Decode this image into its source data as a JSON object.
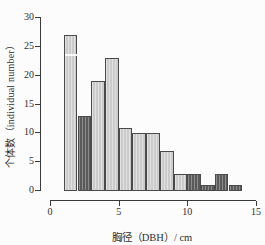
{
  "chart_data": {
    "type": "bar",
    "subtype": "histogram",
    "title": "",
    "xlabel": "胸径（DBH）/ cm",
    "ylabel": "个体数（individual number）",
    "xlim": [
      0,
      15
    ],
    "ylim": [
      0,
      30
    ],
    "xticks": [
      0,
      5,
      10,
      15
    ],
    "yticks": [
      0,
      5,
      10,
      15,
      20,
      25,
      30
    ],
    "grid": false,
    "legend": "none",
    "bin_width_cm": 1,
    "bins": [
      {
        "start": 1,
        "end": 2,
        "value": 27,
        "series": "light"
      },
      {
        "start": 2,
        "end": 3,
        "value": 13,
        "series": "dark"
      },
      {
        "start": 3,
        "end": 4,
        "value": 19,
        "series": "light"
      },
      {
        "start": 4,
        "end": 5,
        "value": 23,
        "series": "light"
      },
      {
        "start": 5,
        "end": 6,
        "value": 11,
        "series": "light"
      },
      {
        "start": 6,
        "end": 7,
        "value": 10,
        "series": "light"
      },
      {
        "start": 7,
        "end": 8,
        "value": 10,
        "series": "light"
      },
      {
        "start": 8,
        "end": 9,
        "value": 7,
        "series": "light"
      },
      {
        "start": 9,
        "end": 10,
        "value": 3,
        "series": "light"
      },
      {
        "start": 10,
        "end": 11,
        "value": 3,
        "series": "dark"
      },
      {
        "start": 11,
        "end": 12,
        "value": 1,
        "series": "dark"
      },
      {
        "start": 12,
        "end": 13,
        "value": 3,
        "series": "dark"
      },
      {
        "start": 13,
        "end": 14,
        "value": 1,
        "series": "dark"
      }
    ],
    "colors": {
      "light": "#d6d6d6",
      "dark": "#5f5f5f",
      "bar-border": "#4a4a4a",
      "axis": "#3a3a3a",
      "text": "#2e2e2e"
    }
  }
}
